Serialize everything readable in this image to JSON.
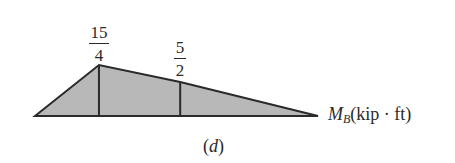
{
  "diagram": {
    "type": "moment influence line",
    "fill_color": "#b8b8b8",
    "stroke_color": "#2a2a2a",
    "peak_value": {
      "numerator": "15",
      "denominator": "4",
      "value": 3.75
    },
    "mid_value": {
      "numerator": "5",
      "denominator": "2",
      "value": 2.5
    },
    "axis_label": {
      "symbol": "M",
      "subscript": "B",
      "units": "(kip · ft)"
    },
    "caption": {
      "open": "(",
      "letter": "d",
      "close": ")"
    },
    "profile": [
      {
        "x": 0,
        "y": 0
      },
      {
        "x": 0.226,
        "y": 3.75
      },
      {
        "x": 0.513,
        "y": 2.5
      },
      {
        "x": 1,
        "y": 0
      }
    ]
  }
}
